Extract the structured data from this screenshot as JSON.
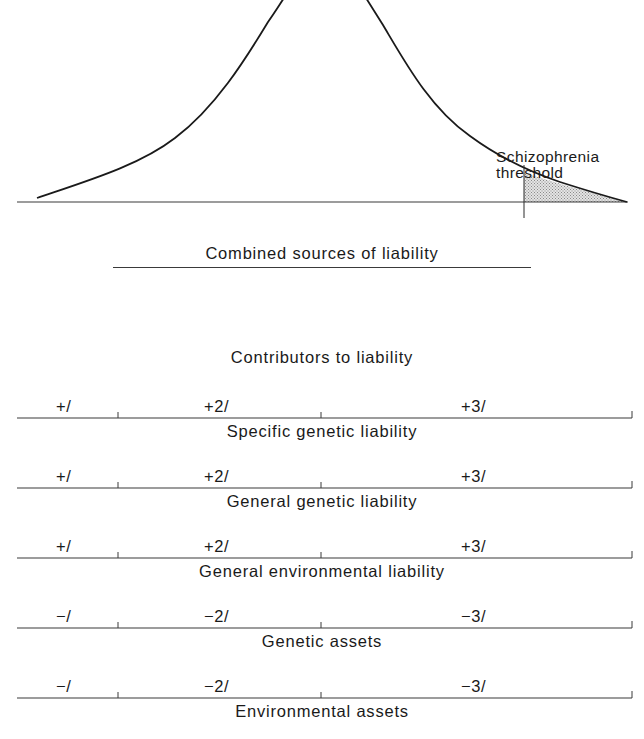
{
  "distribution": {
    "threshold_label_line1": "Schizophrenia",
    "threshold_label_line2": "threshold",
    "curve_color": "#1a1a1a",
    "shade_color": "#bdbdbd"
  },
  "combined": {
    "title": "Combined sources of liability"
  },
  "contributors": {
    "title": "Contributors to liability",
    "rows": [
      {
        "labels": [
          "+/",
          "+2/",
          "+3/"
        ],
        "title": "Specific genetic liability"
      },
      {
        "labels": [
          "+/",
          "+2/",
          "+3/"
        ],
        "title": "General genetic liability"
      },
      {
        "labels": [
          "+/",
          "+2/",
          "+3/"
        ],
        "title": "General environmental liability"
      },
      {
        "labels": [
          "−/",
          "−2/",
          "−3/"
        ],
        "title": "Genetic assets"
      },
      {
        "labels": [
          "−/",
          "−2/",
          "−3/"
        ],
        "title": "Environmental assets"
      }
    ]
  }
}
